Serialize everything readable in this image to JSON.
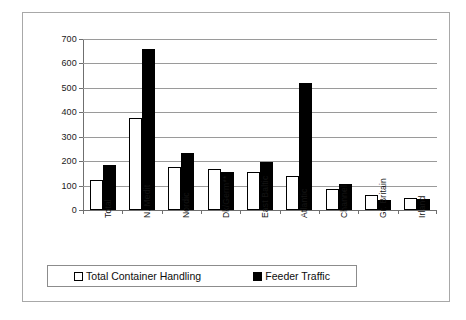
{
  "chart_data": {
    "type": "bar",
    "title": "",
    "subtitle": "",
    "xlabel": "",
    "ylabel": "",
    "ylim": [
      0,
      700
    ],
    "ytick_interval": 100,
    "yticks": [
      0,
      100,
      200,
      300,
      400,
      500,
      600,
      700
    ],
    "ytick_labels": [
      "0",
      "100",
      "200",
      "300",
      "400",
      "500",
      "600",
      "700"
    ],
    "grid": true,
    "grid_axis": "y",
    "legend_position": "bottom",
    "categories": [
      "Total",
      "N. Medit",
      "Nordic",
      "Dk/Germ**",
      "East Baltic",
      "Atlantic",
      "Channel",
      "Gr. Britain",
      "Irland"
    ],
    "series": [
      {
        "name": "Total Container Handling",
        "color": "#ffffff",
        "edge_color": "#000000",
        "marker": "hollow-square",
        "values": [
          123,
          375,
          175,
          167,
          157,
          140,
          88,
          63,
          50
        ]
      },
      {
        "name": "Feeder Traffic",
        "color": "#000000",
        "edge_color": "#000000",
        "marker": "filled-square",
        "values": [
          184,
          660,
          235,
          157,
          197,
          520,
          107,
          40,
          47
        ]
      }
    ],
    "annotations": []
  },
  "legend": {
    "entries": [
      {
        "label": "Total Container Handling",
        "swatch": "hollow"
      },
      {
        "label": "Feeder Traffic",
        "swatch": "filled"
      }
    ]
  },
  "colors": {
    "frame": "#a8a8a8",
    "axis": "#6f6f6f",
    "gridline": "#9a9a9a",
    "series_hollow": "#ffffff",
    "series_filled": "#000000",
    "background": "#ffffff"
  }
}
